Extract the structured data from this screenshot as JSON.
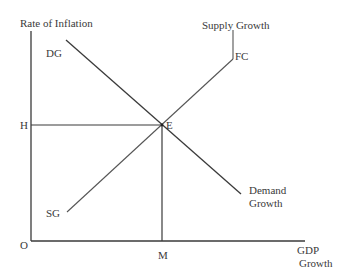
{
  "diagram": {
    "type": "economics-supply-demand-growth",
    "y_axis_label": "Rate of Inflation",
    "x_axis_label_line1": "GDP",
    "x_axis_label_line2": "Growth",
    "origin_label": "O",
    "equilibrium_label": "E",
    "inflation_level_label": "H",
    "gdp_level_label": "M",
    "demand_curve": {
      "start_label": "DG",
      "end_label_line1": "Demand",
      "end_label_line2": "Growth"
    },
    "supply_curve": {
      "start_label": "SG",
      "kink_label": "FC",
      "end_label": "Supply Growth"
    },
    "colors": {
      "axis": "#333333",
      "line": "#333333",
      "text": "#3a3a3a",
      "background": "#ffffff"
    }
  }
}
